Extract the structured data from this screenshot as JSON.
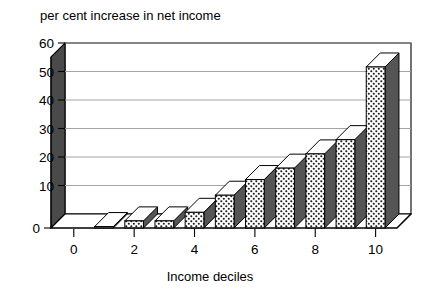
{
  "chart_data": {
    "type": "bar",
    "title": "per cent increase in net income",
    "xlabel": "Income deciles",
    "ylabel": "",
    "categories": [
      "0",
      "1",
      "2",
      "3",
      "4",
      "5",
      "6",
      "7",
      "8",
      "9",
      "10"
    ],
    "values": [
      0,
      0.5,
      2.5,
      2.5,
      5.5,
      11.5,
      17,
      21,
      26,
      31,
      56.5
    ],
    "x": [
      0,
      1,
      2,
      3,
      4,
      5,
      6,
      7,
      8,
      9,
      10
    ],
    "xlim": [
      -0.5,
      10.5
    ],
    "ylim": [
      0,
      60
    ],
    "xticks": [
      0,
      2,
      4,
      6,
      8,
      10
    ],
    "xtick_labels": [
      "0",
      "2",
      "4",
      "6",
      "8",
      "10"
    ],
    "yticks": [
      0,
      10,
      20,
      30,
      40,
      50,
      60
    ],
    "ytick_labels": [
      "0",
      "10",
      "20",
      "30",
      "40",
      "50",
      "60"
    ],
    "grid": "horizontal",
    "legend": null,
    "style": "3d-bars-stippled"
  },
  "colors": {
    "bar_front": "#ffffff",
    "bar_front_pattern_dot": "#1a1a1a",
    "bar_side": "#555555",
    "bar_top": "#ffffff",
    "bar_outline": "#000000",
    "axis": "#000000",
    "gridline": "#9a9a9a",
    "wall_side": "#4a4a4a",
    "floor": "#ffffff",
    "background": "#ffffff"
  },
  "labels": {
    "title": "per cent increase in net income",
    "x_axis_title": "Income deciles"
  }
}
